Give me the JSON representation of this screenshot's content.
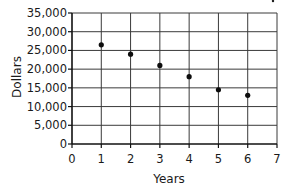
{
  "chart_data": {
    "type": "scatter",
    "title": "",
    "xlabel": "Years",
    "ylabel": "Dollars",
    "xlim": [
      0,
      7
    ],
    "ylim": [
      0,
      35000
    ],
    "x_ticks": [
      0,
      1,
      2,
      3,
      4,
      5,
      6,
      7
    ],
    "x_tick_labels": [
      "0",
      "1",
      "2",
      "3",
      "4",
      "5",
      "6",
      "7"
    ],
    "y_ticks": [
      0,
      5000,
      10000,
      15000,
      20000,
      25000,
      30000,
      35000
    ],
    "y_tick_labels": [
      "0",
      "5,000",
      "10,000",
      "15,000",
      "20,000",
      "25,000",
      "30,000",
      "35,000"
    ],
    "grid": true,
    "legend": null,
    "series": [
      {
        "name": "Value",
        "x": [
          1,
          2,
          3,
          4,
          5,
          6
        ],
        "y": [
          26500,
          24000,
          21000,
          18000,
          14500,
          13000
        ]
      }
    ]
  },
  "colors": {
    "grid": "#3a3a3a",
    "axis": "#111111",
    "point": "#0d0d0d",
    "text": "#1a1a1a",
    "background": "#ffffff"
  }
}
